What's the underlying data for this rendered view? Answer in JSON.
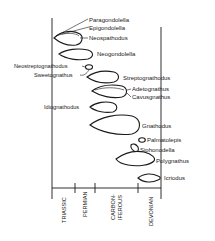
{
  "diagram": {
    "type": "stratigraphic range chart (conodont genera)",
    "taxa": [
      {
        "name": "Paragondolella"
      },
      {
        "name": "Epigondolella"
      },
      {
        "name": "Neospathodus"
      },
      {
        "name": "Neogondolella"
      },
      {
        "name": "Neostreptognathodus"
      },
      {
        "name": "Sweetognathus"
      },
      {
        "name": "Streptognathodus"
      },
      {
        "name": "Adetognathus"
      },
      {
        "name": "Cavusgnathus"
      },
      {
        "name": "Idiognathodus"
      },
      {
        "name": "Gnathodus"
      },
      {
        "name": "Palmatolepis"
      },
      {
        "name": "Siphonodella"
      },
      {
        "name": "Polygnathus"
      },
      {
        "name": "Icriodus"
      }
    ],
    "periods": [
      {
        "name": "TRIASSIC"
      },
      {
        "name": "PERMIAN"
      },
      {
        "name": "CARBON-",
        "name2": "IFEROUS"
      },
      {
        "name": "DEVONIAN"
      }
    ],
    "colors": {
      "ink": "#1a1a1a",
      "background": "#ffffff"
    }
  }
}
